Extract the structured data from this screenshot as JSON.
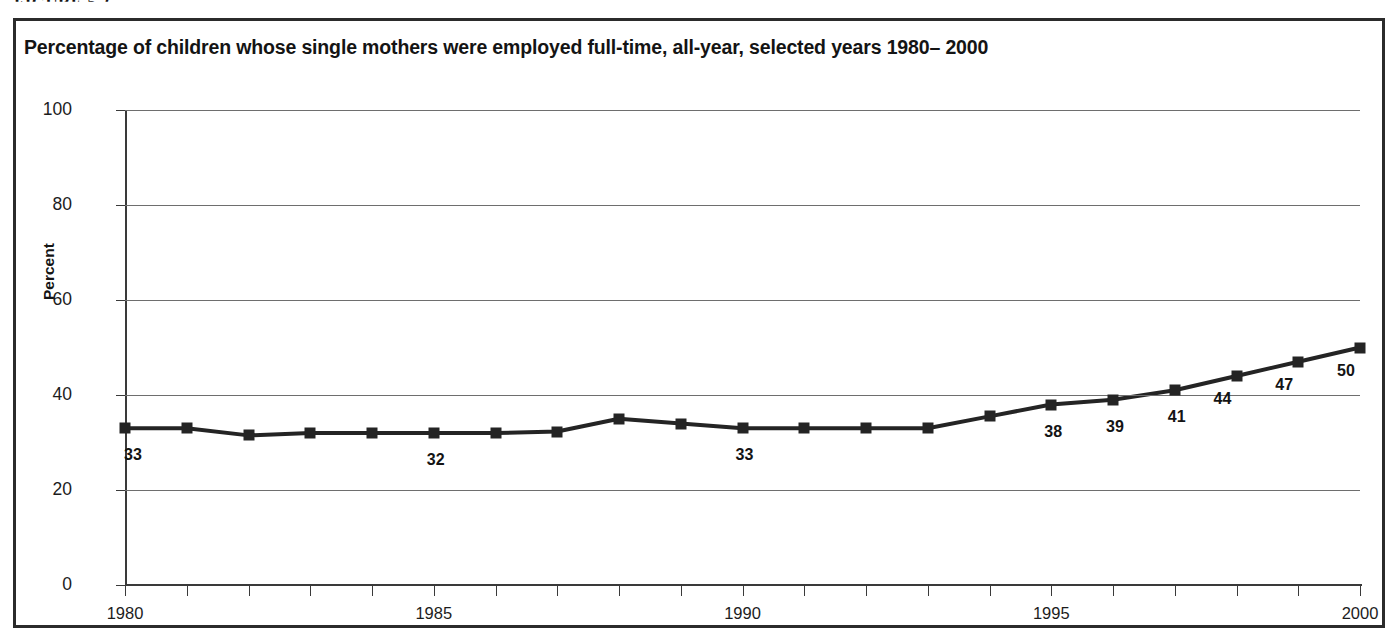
{
  "figure_header": "FIGURE 5.2",
  "chart_title": "Percentage of children whose single mothers were employed full-time, all-year, selected years 1980– 2000",
  "axis": {
    "y_title": "Percent",
    "y_ticks": [
      "0",
      "20",
      "40",
      "60",
      "80",
      "100"
    ],
    "x_ticks": [
      "1980",
      "1985",
      "1990",
      "1995",
      "2000"
    ]
  },
  "colors": {
    "line": "#242424",
    "marker": "#242424",
    "gridline": "#6e6e6e",
    "frame": "#2b2b2b",
    "text": "#141414",
    "background": "#ffffff"
  },
  "chart_data": {
    "type": "line",
    "title": "Percentage of children whose single mothers were employed full-time, all-year, selected years 1980– 2000",
    "xlabel": "",
    "ylabel": "Percent",
    "ylim": [
      0,
      100
    ],
    "xlim": [
      1980,
      2000
    ],
    "yticks": [
      0,
      20,
      40,
      60,
      80,
      100
    ],
    "xticks": [
      1980,
      1985,
      1990,
      1995,
      2000
    ],
    "grid": true,
    "legend": false,
    "marker": "square",
    "x": [
      1980,
      1981,
      1982,
      1983,
      1984,
      1985,
      1986,
      1987,
      1988,
      1989,
      1990,
      1991,
      1992,
      1993,
      1994,
      1995,
      1996,
      1997,
      1998,
      1999,
      2000
    ],
    "values": [
      33,
      33,
      31.5,
      32,
      32,
      32,
      32,
      32.3,
      35,
      34,
      33,
      33,
      33,
      33,
      35.5,
      38,
      39,
      41,
      44,
      47,
      50
    ],
    "point_labels": [
      {
        "x": 1980,
        "text": "33"
      },
      {
        "x": 1985,
        "text": "32"
      },
      {
        "x": 1990,
        "text": "33"
      },
      {
        "x": 1995,
        "text": "38"
      },
      {
        "x": 1996,
        "text": "39"
      },
      {
        "x": 1997,
        "text": "41"
      },
      {
        "x": 1998,
        "text": "44"
      },
      {
        "x": 1999,
        "text": "47"
      },
      {
        "x": 2000,
        "text": "50"
      }
    ]
  }
}
